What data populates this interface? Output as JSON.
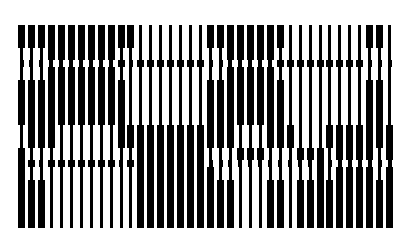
{
  "artwork": {
    "title": "Op-art vertical bar pattern",
    "background": "#ffffff",
    "ink": "#000000",
    "origin_x": 18,
    "pitch": 9.95,
    "wide": 7,
    "narrow": 3,
    "nub": 7,
    "bands": [
      {
        "name": "top",
        "y0": 25,
        "y1": 48
      },
      {
        "name": "pinch-upper-a",
        "y0": 48,
        "y1": 60
      },
      {
        "name": "pinch-upper-nub",
        "y0": 60,
        "y1": 67
      },
      {
        "name": "pinch-upper-b",
        "y0": 67,
        "y1": 80
      },
      {
        "name": "tall",
        "y0": 80,
        "y1": 125
      },
      {
        "name": "middle",
        "y0": 125,
        "y1": 148
      },
      {
        "name": "pinch-lower-a",
        "y0": 148,
        "y1": 160
      },
      {
        "name": "pinch-lower-nub",
        "y0": 160,
        "y1": 167
      },
      {
        "name": "pinch-lower-b",
        "y0": 167,
        "y1": 180
      },
      {
        "name": "bottom",
        "y0": 180,
        "y1": 228
      }
    ],
    "columns": [
      "WNNNWNWWWW",
      "WNNNWWNWNW",
      "WNNNWWNNNW",
      "WWNWWWNWNN",
      "WWNWWNNWNN",
      "WWNWWNNWNN",
      "WWNWWNNWNN",
      "WWNWWNNWNN",
      "WWNWWNNWNN",
      "WWNWWNNWNN",
      "WNWNWWNNNN",
      "WNNNNWNWNN",
      "NNWNNWWWWW",
      "NNWNNWWWWW",
      "NNWNNWWWWW",
      "NNWNNWWWWW",
      "NNWNNWWWWW",
      "NNWNNWWWWW",
      "NNWNNWWWWW",
      "WNNNWWNNWW",
      "WNNNWWNNNW",
      "WWNWWWNNNW",
      "WWNWWNWNNN",
      "WWNWWNWNNN",
      "WWNWWNWNNN",
      "WWNWWWNNNW",
      "WNWNWWNNNW",
      "NNWNNWNNNN",
      "NNWNNNWNNW",
      "NNWNNNWNNW",
      "NNWNNNWWWW",
      "NNWNNWNNNW",
      "NNWNNWWNWW",
      "NNWNNWWNWW",
      "NNWNNWWNWW",
      "WNNNWWWNWW",
      "WNNNWWNNNW",
      "NNNNNWWNWW"
    ]
  }
}
